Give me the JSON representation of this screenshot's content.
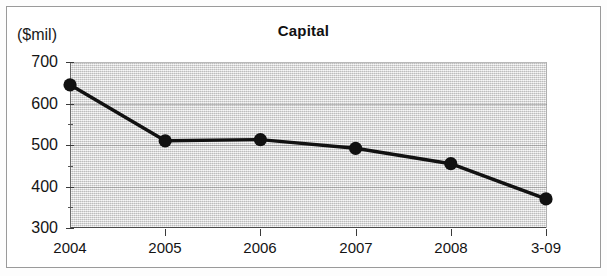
{
  "figure": {
    "unit_label": "($mil)",
    "title": "Capital"
  },
  "axes": {
    "y_labels": [
      "700",
      "600",
      "500",
      "400",
      "300"
    ],
    "y_minor_values": [
      650,
      550,
      450,
      350
    ],
    "x_labels": [
      "2004",
      "2005",
      "2006",
      "2007",
      "2008",
      "3-09"
    ]
  },
  "chart_data": {
    "type": "line",
    "title": "Capital",
    "xlabel": "",
    "ylabel": "($mil)",
    "categories": [
      "2004",
      "2005",
      "2006",
      "2007",
      "2008",
      "3-09"
    ],
    "values": [
      645,
      510,
      513,
      492,
      455,
      370
    ],
    "ylim": [
      300,
      700
    ],
    "ytick_step": 100,
    "yminor_step": 50,
    "grid": true,
    "grid_axis": "y",
    "legend": "none",
    "marker": "filled-circle",
    "line_color": "#111111",
    "marker_color": "#111111",
    "plot_background": "#dcdcdc",
    "series": [
      {
        "name": "Capital",
        "values": [
          645,
          510,
          513,
          492,
          455,
          370
        ]
      }
    ]
  }
}
